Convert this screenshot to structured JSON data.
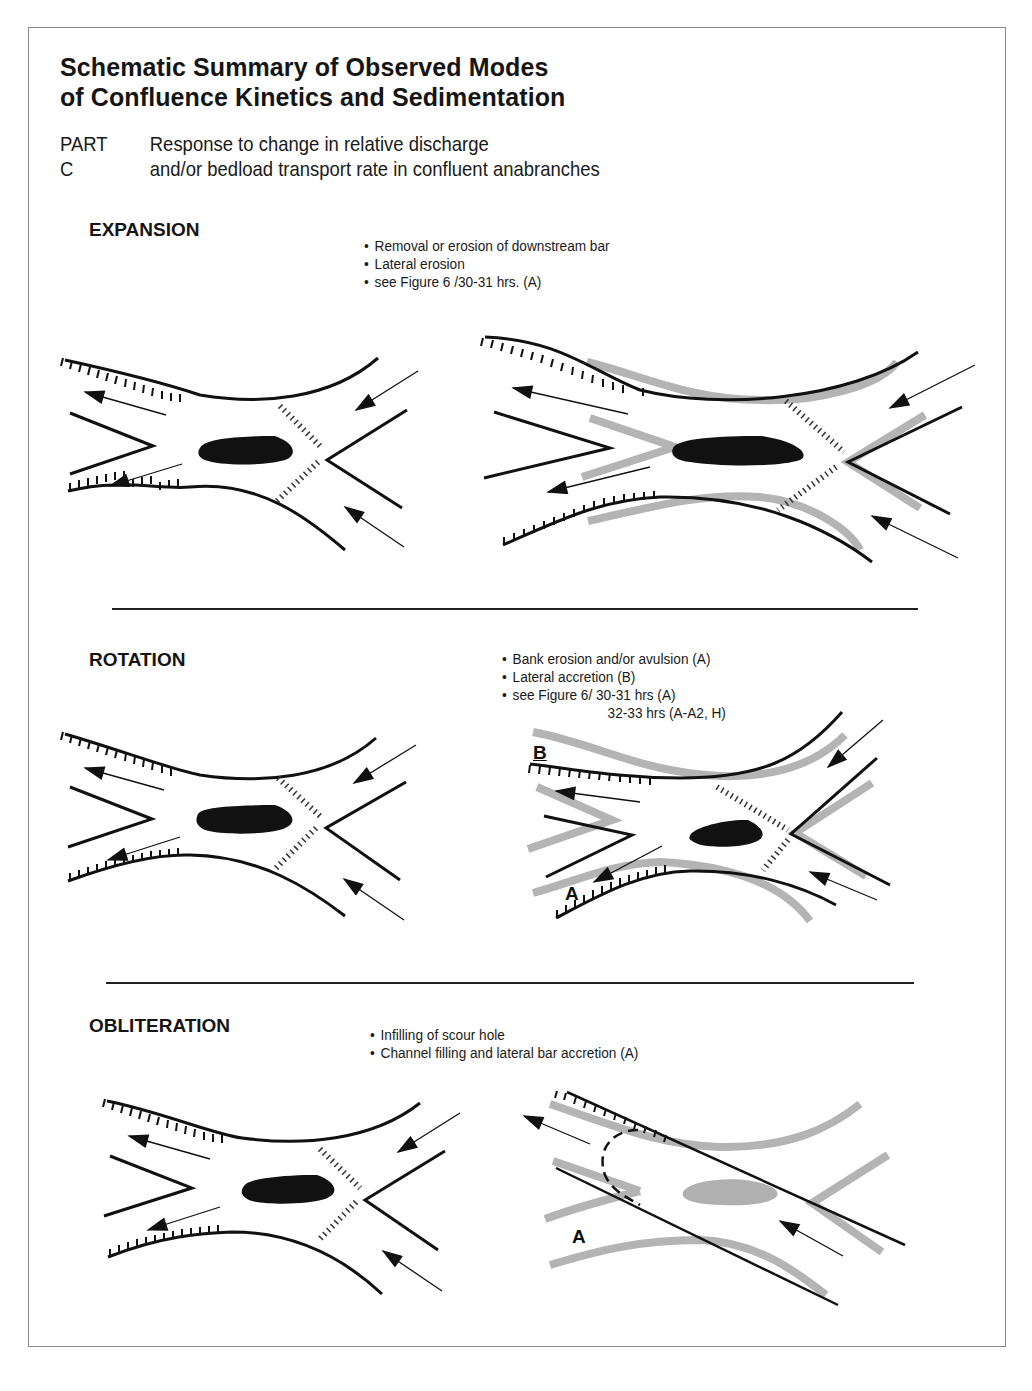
{
  "figure": {
    "title_line1": "Schematic Summary of Observed Modes",
    "title_line2": "of Confluence Kinetics and Sedimentation",
    "part_label": "PART C",
    "part_text_line1": "Response to change in relative discharge",
    "part_text_line2": "and/or bedload transport rate in confluent anabranches"
  },
  "sections": [
    {
      "title": "EXPANSION",
      "bullets": [
        "Removal or erosion of downstream bar",
        "Lateral erosion",
        "see Figure 6 /30-31 hrs. (A)"
      ],
      "diagram_labels": []
    },
    {
      "title": "ROTATION",
      "bullets": [
        "Bank erosion and/or avulsion (A)",
        "Lateral accretion (B)",
        "see Figure 6/ 30-31 hrs (A)"
      ],
      "bullet_continuation": "32-33 hrs (A-A2, H)",
      "diagram_labels": [
        "B",
        "A"
      ]
    },
    {
      "title": "OBLITERATION",
      "bullets": [
        "Infilling of scour hole",
        "Channel filling and lateral bar accretion (A)"
      ],
      "diagram_labels": [
        "A"
      ]
    }
  ],
  "legend_semantics": {
    "black_line": "channel bank (initial)",
    "hatched_line": "eroding bank",
    "grey_band": "new bank position",
    "black_blob": "scour hole",
    "grey_blob": "infilled scour hole",
    "dotted_line": "avalanche face / shear zone",
    "arrow": "flow direction"
  },
  "colors": {
    "ink": "#111111",
    "grey_band": "#b4b4b4",
    "frame": "#8a8a8a"
  }
}
